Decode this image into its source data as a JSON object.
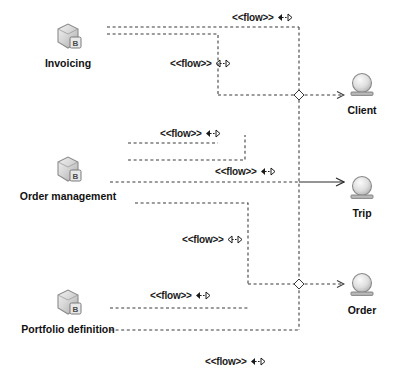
{
  "diagram": {
    "background_color": "#ffffff",
    "line_color": "#3a3a3a",
    "text_color": "#111111"
  },
  "components": [
    {
      "id": "invoicing",
      "label": "Invoicing",
      "icon": "component-icon",
      "badge": "B",
      "x": 68,
      "y": 22
    },
    {
      "id": "order-mgmt",
      "label": "Order management",
      "icon": "component-icon",
      "badge": "B",
      "x": 68,
      "y": 155
    },
    {
      "id": "portfolio",
      "label": "Portfolio definition",
      "icon": "component-icon",
      "badge": "B",
      "x": 68,
      "y": 288
    }
  ],
  "interfaces": [
    {
      "id": "client",
      "label": "Client",
      "icon": "ball-pedestal-icon",
      "x": 362,
      "y": 72
    },
    {
      "id": "trip",
      "label": "Trip",
      "icon": "ball-pedestal-icon",
      "x": 362,
      "y": 175
    },
    {
      "id": "order",
      "label": "Order",
      "icon": "ball-pedestal-icon",
      "x": 362,
      "y": 272
    }
  ],
  "flows": [
    {
      "id": "flow-1",
      "text": "<<flow>>",
      "glyph": "double-arrow-icon",
      "x": 232,
      "y": 12
    },
    {
      "id": "flow-2",
      "text": "<<flow>>",
      "glyph": "double-arrow-icon",
      "x": 170,
      "y": 58
    },
    {
      "id": "flow-3",
      "text": "<<flow>>",
      "glyph": "double-arrow-icon",
      "x": 160,
      "y": 128
    },
    {
      "id": "flow-4",
      "text": "<<flow>>",
      "glyph": "double-arrow-icon",
      "x": 215,
      "y": 166
    },
    {
      "id": "flow-5",
      "text": "<<flow>>",
      "glyph": "double-arrow-icon",
      "x": 182,
      "y": 234
    },
    {
      "id": "flow-6",
      "text": "<<flow>>",
      "glyph": "double-arrow-icon",
      "x": 150,
      "y": 290
    },
    {
      "id": "flow-7",
      "text": "<<flow>>",
      "glyph": "double-arrow-icon",
      "x": 205,
      "y": 356
    }
  ],
  "connections": [
    {
      "id": "conn-invoicing-top",
      "from": "invoicing",
      "to": "client",
      "style": "dashed"
    },
    {
      "id": "conn-invoicing-second",
      "from": "invoicing",
      "to": "client",
      "style": "dashed"
    },
    {
      "id": "conn-invoicing-third",
      "from": "invoicing",
      "to": "client",
      "style": "dashed"
    },
    {
      "id": "conn-order-mgmt-upper",
      "from": "order-mgmt",
      "to": "trip",
      "style": "dashed"
    },
    {
      "id": "conn-order-mgmt-solid",
      "from": "order-mgmt",
      "to": "trip",
      "style": "solid"
    },
    {
      "id": "conn-order-mgmt-lower",
      "from": "order-mgmt",
      "to": "order",
      "style": "dashed"
    },
    {
      "id": "conn-portfolio-upper",
      "from": "portfolio",
      "to": "order",
      "style": "dashed"
    },
    {
      "id": "conn-portfolio-lower",
      "from": "portfolio",
      "to": "order",
      "style": "dashed"
    }
  ],
  "junctions": [
    {
      "id": "junction-client",
      "x": 299,
      "y": 95
    },
    {
      "id": "junction-order",
      "x": 299,
      "y": 284
    }
  ]
}
